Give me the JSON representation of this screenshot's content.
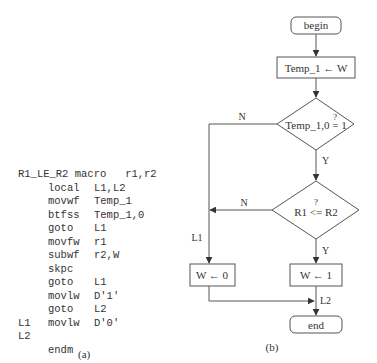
{
  "panel_a": {
    "caption": "(a)",
    "header": {
      "label": "R1_LE_R2",
      "op": "macro",
      "args": "r1,r2"
    },
    "lines": [
      {
        "label": "",
        "op": "local",
        "arg": "L1,L2"
      },
      {
        "label": "",
        "op": "movwf",
        "arg": "Temp_1"
      },
      {
        "label": "",
        "op": "btfss",
        "arg": "Temp_1,0"
      },
      {
        "label": "",
        "op": "goto",
        "arg": "L1"
      },
      {
        "label": "",
        "op": "movfw",
        "arg": "r1"
      },
      {
        "label": "",
        "op": "subwf",
        "arg": "r2,W"
      },
      {
        "label": "",
        "op": "skpc",
        "arg": ""
      },
      {
        "label": "",
        "op": "goto",
        "arg": "L1"
      },
      {
        "label": "",
        "op": "movlw",
        "arg": "D'1'"
      },
      {
        "label": "",
        "op": "goto",
        "arg": "L2"
      },
      {
        "label": "L1",
        "op": "movlw",
        "arg": "D'0'"
      },
      {
        "label": "L2",
        "op": "",
        "arg": ""
      },
      {
        "label": "",
        "op": "endm",
        "arg": ""
      }
    ]
  },
  "panel_b": {
    "caption": "(b)",
    "nodes": {
      "begin": "begin",
      "assign_temp": "Temp_1 ← W",
      "decision1_q": "?",
      "decision1": "Temp_1,0 = 1",
      "decision2_q": "?",
      "decision2": "R1 <= R2",
      "w0": "W ← 0",
      "w1": "W ← 1",
      "end": "end"
    },
    "edge_labels": {
      "d1_no": "N",
      "d1_yes": "Y",
      "d2_no": "N",
      "d2_yes": "Y",
      "l1": "L1",
      "l2": "L2"
    }
  }
}
